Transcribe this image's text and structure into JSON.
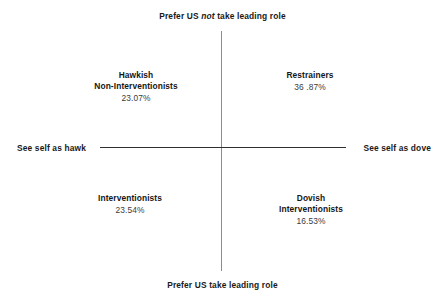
{
  "chart_data": {
    "type": "scatter",
    "title": "",
    "subtitle": "",
    "layout": "quadrant-2x2",
    "grid": false,
    "legend_position": "none",
    "axes": {
      "x": {
        "label": "",
        "left_pole": "See self as hawk",
        "right_pole": "See self as dove"
      },
      "y": {
        "label": "",
        "top_pole_prefix": "Prefer US ",
        "top_pole_emphasis": "not",
        "top_pole_suffix": " take leading role",
        "top_pole_full": "Prefer US not take leading role",
        "bottom_pole": "Prefer US take leading role"
      }
    },
    "categories": [
      "Hawkish Non-Interventionists",
      "Restrainers",
      "Interventionists",
      "Dovish Interventionists"
    ],
    "values": [
      23.07,
      36.87,
      23.54,
      16.53
    ],
    "value_labels": [
      "23.07%",
      "36 .87%",
      "23.54%",
      "16.53%"
    ],
    "quadrants": [
      {
        "position": "top-left",
        "name_line1": "Hawkish",
        "name_line2": "Non-Interventionists",
        "value": "23.07%"
      },
      {
        "position": "top-right",
        "name_line1": "Restrainers",
        "name_line2": "",
        "value": "36 .87%"
      },
      {
        "position": "bottom-left",
        "name_line1": "Interventionists",
        "name_line2": "",
        "value": "23.54%"
      },
      {
        "position": "bottom-right",
        "name_line1": "Dovish",
        "name_line2": "Interventionists",
        "value": "16.53%"
      }
    ],
    "colors": {
      "background": "#ffffff",
      "vertical_axis": "#8c8c8c",
      "horizontal_axis": "#2f2f2f",
      "label_text": "#161616",
      "value_text": "#3c3c3c"
    }
  }
}
